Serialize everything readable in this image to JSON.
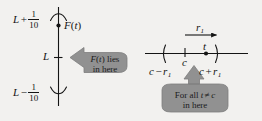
{
  "figure": {
    "background_color": "#f2f1ef",
    "ink_color": "#141414",
    "callout_fill": "#919191",
    "callout_stroke": "#7d7d7d"
  },
  "left_panel": {
    "name": "vertical-value-axis",
    "axis_orientation": "vertical",
    "labels": {
      "upper_bound": {
        "base": "L",
        "operator": "+",
        "numerator": "1",
        "denominator": "10"
      },
      "center": "L",
      "lower_bound": {
        "base": "L",
        "operator": "−",
        "numerator": "1",
        "denominator": "10"
      }
    },
    "point": {
      "label_function": "F",
      "label_variable": "t",
      "label_full": "F(t)"
    },
    "callout": {
      "direction": "left",
      "line1_math": "F(t)",
      "line1_function": "F",
      "line1_variable": "t",
      "line1_suffix": " lies",
      "line2": "in here"
    }
  },
  "right_panel": {
    "name": "horizontal-number-line",
    "axis_orientation": "horizontal",
    "radius_label": {
      "symbol": "r",
      "subscript": "1"
    },
    "interval": {
      "left_bracket": "(",
      "right_bracket": ")",
      "left_endpoint": {
        "center": "c",
        "operator": "−",
        "radius": "r",
        "subscript": "1"
      },
      "right_endpoint": {
        "center": "c",
        "operator": "+",
        "radius": "r",
        "subscript": "1"
      },
      "center_tick_label": "c"
    },
    "point": {
      "label": "t"
    },
    "callout": {
      "direction": "up",
      "line1_prefix": "For all ",
      "line1_variable": "t",
      "line1_relation": "≠",
      "line1_center": "c",
      "line2": "in here"
    }
  }
}
